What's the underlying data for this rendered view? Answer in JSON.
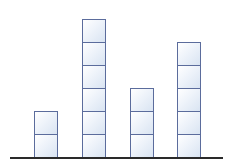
{
  "chart_data": {
    "type": "bar",
    "style": "stacked unit blocks (pictograph)",
    "categories": [
      "",
      "",
      "",
      ""
    ],
    "values": [
      2,
      6,
      3,
      5
    ],
    "title": "",
    "xlabel": "",
    "ylabel": "",
    "ylim": [
      0,
      6
    ],
    "grid": false,
    "legend": null
  },
  "colors": {
    "block_border": "#5b6c9c",
    "block_fill_light": "#ffffff",
    "block_fill_dark": "#d9e4f2",
    "baseline": "#2a2a2a"
  },
  "layout": {
    "bar_left_px": [
      34,
      82,
      130,
      177
    ],
    "block_height_px": 24.5,
    "bar_width_px": 24
  }
}
